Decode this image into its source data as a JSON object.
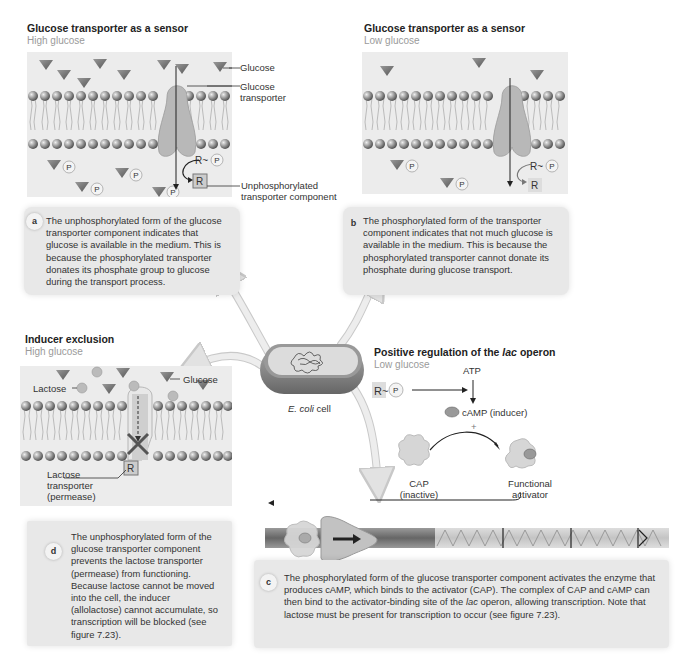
{
  "panels": {
    "high_sensor": {
      "title": "Glucose transporter as a sensor",
      "subtitle": "High glucose",
      "labels": {
        "glucose": "Glucose",
        "transporter": "Glucose\ntransporter",
        "transporter_l1": "Glucose",
        "transporter_l2": "transporter",
        "unphos_l1": "Unphosphorylated",
        "unphos_l2": "transporter component",
        "r": "R",
        "p": "P"
      }
    },
    "low_sensor": {
      "title": "Glucose transporter as a sensor",
      "subtitle": "Low glucose",
      "labels": {
        "r": "R",
        "p": "P"
      }
    },
    "inducer_exclusion": {
      "title": "Inducer exclusion",
      "subtitle": "High glucose",
      "labels": {
        "lactose": "Lactose",
        "glucose": "Glucose",
        "permease_l1": "Lactose",
        "permease_l2": "transporter",
        "permease_l3": "(permease)",
        "r": "R"
      }
    },
    "positive_regulation": {
      "title_pre": "Positive regulation of the ",
      "title_italic": "lac",
      "title_post": " operon",
      "subtitle": "Low glucose",
      "labels": {
        "atp": "ATP",
        "camp": "cAMP (inducer)",
        "plus": "+",
        "cap_l1": "CAP",
        "cap_l2": "(inactive)",
        "func_l1": "Functional",
        "func_l2": "activator",
        "r": "R",
        "p": "P"
      }
    }
  },
  "cell": {
    "label_italic": "E. coli",
    "label_rest": " cell"
  },
  "notes": [
    {
      "id": "a",
      "text": "The unphosphorylated form of the glucose transporter component indicates that glucose is available in the medium. This is because the phosphorylated transporter donates its phosphate group to glucose during the transport process."
    },
    {
      "id": "b",
      "text": "The phosphorylated form of the transporter component indicates that not much glucose is available in the medium. This is because the phosphorylated transporter cannot donate its phosphate during glucose transport."
    },
    {
      "id": "c",
      "text_pre": "The phosphorylated form of the glucose transporter component activates the enzyme that produces cAMP, which binds to the activator (CAP). The complex of CAP and cAMP can then bind to the activator-binding site of the ",
      "text_italic": "lac",
      "text_post": " operon, allowing transcription. Note that lactose must be present for transcription to occur (see figure 7.23)."
    },
    {
      "id": "d",
      "text": "The unphosphorylated form of the glucose transporter component prevents the lactose transporter (permease) from functioning. Because lactose cannot be moved into the cell, the inducer (allolactose) cannot accumulate, so transcription will be blocked (see figure 7.23)."
    }
  ],
  "colors": {
    "panel_bg": "#ececec",
    "note_bg": "#e8e8e8",
    "glucose": "#7a7a7a",
    "transporter": "#b4b4b4",
    "arrow": "#d8d8d8"
  }
}
